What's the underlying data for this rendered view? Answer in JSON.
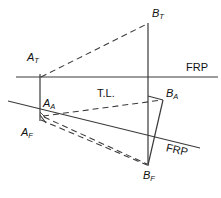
{
  "diagram": {
    "stroke_color": "#3a3a3a",
    "text_color": "#111111",
    "background": "#ffffff",
    "labels": {
      "a_top": "A",
      "a_top_sub": "T",
      "b_top": "B",
      "b_top_sub": "T",
      "a_front": "A",
      "a_front_sub": "F",
      "b_front": "B",
      "b_front_sub": "F",
      "a_aux": "A",
      "a_aux_sub": "A",
      "b_aux": "B",
      "b_aux_sub": "A",
      "frp_upper": "FRP",
      "frp_lower": "FRP",
      "true_length": "T.L."
    },
    "points": {
      "A_T": {
        "x": 40,
        "y": 77
      },
      "B_T": {
        "x": 148,
        "y": 23
      },
      "A_F": {
        "x": 40,
        "y": 120
      },
      "B_F": {
        "x": 148,
        "y": 165
      },
      "A_A": {
        "x": 40,
        "y": 115
      },
      "B_A": {
        "x": 163,
        "y": 100
      }
    },
    "lines": {
      "frp_upper": {
        "x1": 16,
        "y1": 77,
        "x2": 218,
        "y2": 77,
        "style": "solid"
      },
      "frp_lower": {
        "x1": 8,
        "y1": 101,
        "x2": 200,
        "y2": 148,
        "style": "solid"
      },
      "vertical_A": {
        "x1": 40,
        "y1": 74,
        "x2": 40,
        "y2": 120,
        "style": "solid"
      },
      "vertical_B": {
        "x1": 148,
        "y1": 23,
        "x2": 148,
        "y2": 165,
        "style": "solid"
      },
      "AT_BT": {
        "x1": 40,
        "y1": 77,
        "x2": 148,
        "y2": 23,
        "style": "dashed"
      },
      "AF_BF": {
        "x1": 40,
        "y1": 120,
        "x2": 148,
        "y2": 165,
        "style": "dashed"
      },
      "AA_BA": {
        "x1": 43,
        "y1": 116,
        "x2": 163,
        "y2": 100,
        "style": "dashed"
      },
      "AA_BF": {
        "x1": 43,
        "y1": 116,
        "x2": 148,
        "y2": 165,
        "style": "dashed"
      },
      "BA_BF": {
        "x1": 163,
        "y1": 100,
        "x2": 148,
        "y2": 165,
        "style": "solid"
      },
      "BT_BA": {
        "x1": 148,
        "y1": 96,
        "x2": 163,
        "y2": 100,
        "style": "solid"
      },
      "AA_AF": {
        "x1": 40,
        "y1": 116,
        "x2": 46,
        "y2": 123,
        "style": "solid"
      }
    }
  }
}
